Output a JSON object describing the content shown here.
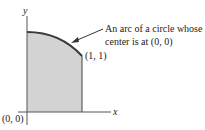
{
  "diagram": {
    "axis_labels": {
      "x": "x",
      "y": "y"
    },
    "origin_label": "(0, 0)",
    "point_label": "(1, 1)",
    "annotation": {
      "line1": "An arc of a circle whose",
      "line2": "center is at (0, 0)"
    },
    "colors": {
      "fill": "#d3d3d3",
      "stroke": "#3a3a3a",
      "axis": "#555555"
    }
  }
}
